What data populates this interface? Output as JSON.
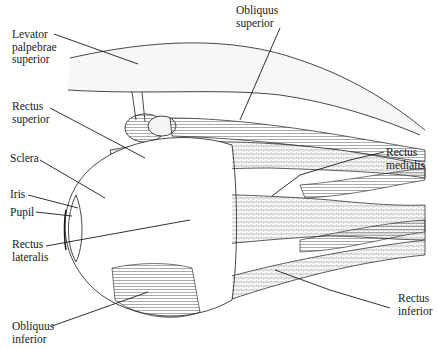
{
  "figure": {
    "colors": {
      "line": "#1a1a1a",
      "muscle_fill": "#f4f4f4",
      "background": "#ffffff"
    }
  },
  "labels": {
    "levator": {
      "line1": "Levator",
      "line2": "palpebrae",
      "line3": "superior"
    },
    "obliquus_superior": {
      "line1": "Obliquus",
      "line2": "superior"
    },
    "rectus_superior": {
      "line1": "Rectus",
      "line2": "superior"
    },
    "sclera": {
      "line1": "Sclera"
    },
    "iris": {
      "line1": "Iris"
    },
    "pupil": {
      "line1": "Pupil"
    },
    "rectus_lateralis": {
      "line1": "Rectus",
      "line2": "lateralis"
    },
    "rectus_medialis": {
      "line1": "Rectus",
      "line2": "medialis"
    },
    "rectus_inferior": {
      "line1": "Rectus",
      "line2": "inferior"
    },
    "obliquus_inferior": {
      "line1": "Obliquus",
      "line2": "inferior"
    }
  }
}
